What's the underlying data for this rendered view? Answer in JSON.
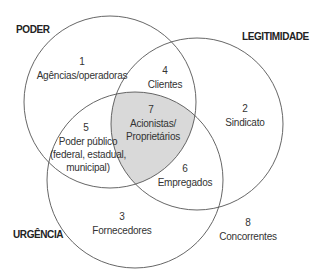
{
  "diagram": {
    "type": "venn",
    "circles": [
      {
        "id": "poder",
        "label": "PODER",
        "cx": 110,
        "cy": 102,
        "r": 86
      },
      {
        "id": "legitimidade",
        "label": "LEGITIMIDADE",
        "cx": 197,
        "cy": 124,
        "r": 86
      },
      {
        "id": "urgencia",
        "label": "URGÊNCIA",
        "cx": 135,
        "cy": 180,
        "r": 88
      }
    ],
    "colors": {
      "stroke": "#555555",
      "center_fill": "#d9d9d9",
      "background": "#ffffff"
    },
    "regions": [
      {
        "number": "1",
        "lines": [
          "Agências/operadoras"
        ]
      },
      {
        "number": "2",
        "lines": [
          "Sindicato"
        ]
      },
      {
        "number": "3",
        "lines": [
          "Fornecedores"
        ]
      },
      {
        "number": "4",
        "lines": [
          "Clientes"
        ]
      },
      {
        "number": "5",
        "lines": [
          "Poder público",
          "(federal, estadual,",
          "municipal)"
        ]
      },
      {
        "number": "6",
        "lines": [
          "Empregados"
        ]
      },
      {
        "number": "7",
        "lines": [
          "Acionistas/",
          "Proprietários"
        ]
      },
      {
        "number": "8",
        "lines": [
          "Concorrentes"
        ]
      }
    ]
  }
}
